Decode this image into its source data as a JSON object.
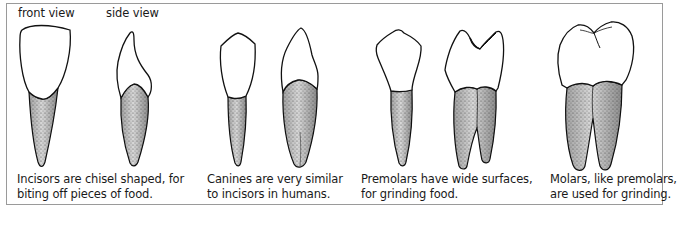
{
  "view_labels": {
    "front": "front view",
    "side": "side view"
  },
  "panels": [
    {
      "tooth": "incisor",
      "caption_lines": [
        "Incisors are chisel shaped, for",
        "biting off pieces of food."
      ]
    },
    {
      "tooth": "canine",
      "caption_lines": [
        "Canines are very similar",
        "to incisors in humans."
      ]
    },
    {
      "tooth": "premolar",
      "caption_lines": [
        "Premolars have wide surfaces,",
        "for grinding food."
      ]
    },
    {
      "tooth": "molar",
      "caption_lines": [
        "Molars, like premolars,",
        "are used for grinding."
      ]
    }
  ],
  "colors": {
    "outline": "#111111",
    "root_fill": "#cfcfcf",
    "crown_fill": "#ffffff",
    "border": "#9a9a9a"
  }
}
